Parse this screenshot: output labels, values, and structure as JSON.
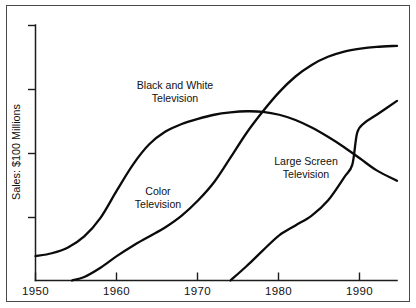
{
  "chart_data": {
    "type": "line",
    "title": "",
    "subtitle": "",
    "xlabel": "",
    "ylabel": "Sales: $100 Millions",
    "xlim": [
      1950,
      1994.5
    ],
    "ylim": [
      0,
      4.4
    ],
    "grid": false,
    "legend_position": "inline-annotations",
    "x_ticks": [
      "1950",
      "1960",
      "1970",
      "1980",
      "1990"
    ],
    "x_tick_values": [
      1950,
      1960,
      1970,
      1980,
      1990
    ],
    "y_ticks": [
      "",
      "",
      "",
      ""
    ],
    "y_tick_values": [
      1,
      2,
      3,
      4
    ],
    "series": [
      {
        "name": "Black and White Television",
        "label_line_1": "Black and White",
        "label_line_2": "Television",
        "color": "#0b0b0b",
        "x": [
          1950,
          1952,
          1954,
          1956,
          1958,
          1960,
          1962,
          1964,
          1966,
          1968,
          1970,
          1972,
          1974,
          1976,
          1978,
          1980,
          1982,
          1984,
          1986,
          1988,
          1990,
          1992,
          1994.5
        ],
        "y": [
          0.42,
          0.47,
          0.57,
          0.76,
          1.08,
          1.55,
          2.0,
          2.35,
          2.57,
          2.7,
          2.79,
          2.86,
          2.9,
          2.92,
          2.91,
          2.86,
          2.77,
          2.64,
          2.48,
          2.3,
          2.1,
          1.9,
          1.72
        ]
      },
      {
        "name": "Color Television",
        "label_line_1": "Color",
        "label_line_2": "Television",
        "color": "#0b0b0b",
        "x": [
          1954.5,
          1956,
          1958,
          1960,
          1962,
          1964,
          1966,
          1968,
          1970,
          1972,
          1974,
          1976,
          1978,
          1980,
          1982,
          1984,
          1986,
          1988,
          1990,
          1992,
          1994.5
        ],
        "y": [
          0.0,
          0.06,
          0.22,
          0.42,
          0.6,
          0.76,
          0.92,
          1.12,
          1.38,
          1.7,
          2.12,
          2.55,
          2.92,
          3.25,
          3.52,
          3.72,
          3.86,
          3.95,
          4.0,
          4.03,
          4.05
        ]
      },
      {
        "name": "Large Screen Television",
        "label_line_1": "Large Screen",
        "label_line_2": "Television",
        "color": "#0b0b0b",
        "x": [
          1974,
          1976,
          1978,
          1980,
          1982,
          1984,
          1986,
          1988,
          1989,
          1989.6,
          1990.5,
          1992,
          1994.5
        ],
        "y": [
          0.0,
          0.25,
          0.52,
          0.78,
          0.95,
          1.12,
          1.38,
          1.78,
          2.0,
          2.55,
          2.72,
          2.86,
          3.1
        ]
      }
    ]
  },
  "axes": {
    "y_axis_title": "Sales: $100 Millions"
  }
}
